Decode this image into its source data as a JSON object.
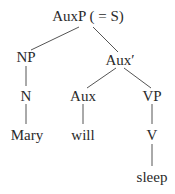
{
  "diagram": {
    "type": "syntax-tree",
    "nodes": {
      "root": "AuxP ( = S)",
      "np": "NP",
      "aux_bar": "Aux′",
      "n": "N",
      "aux": "Aux",
      "vp": "VP",
      "mary": "Mary",
      "will": "will",
      "v": "V",
      "sleep": "sleep"
    },
    "edges": [
      [
        "root",
        "np"
      ],
      [
        "root",
        "aux_bar"
      ],
      [
        "np",
        "n"
      ],
      [
        "n",
        "mary"
      ],
      [
        "aux_bar",
        "aux"
      ],
      [
        "aux_bar",
        "vp"
      ],
      [
        "aux",
        "will"
      ],
      [
        "vp",
        "v"
      ],
      [
        "v",
        "sleep"
      ]
    ]
  }
}
